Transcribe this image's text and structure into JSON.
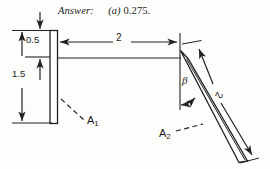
{
  "figure": {
    "answer": {
      "label": "Answer:",
      "part": "(a)",
      "value": "0.275."
    },
    "dimensions": {
      "top_offset": "0.5",
      "lower_height": "1.5",
      "horizontal_span": "2",
      "inclined_length": "2"
    },
    "angle_symbol": "β",
    "plate_labels": {
      "left_plate": "A",
      "left_plate_sub": "1",
      "right_plate": "A",
      "right_plate_sub": "2"
    },
    "colors": {
      "ink": "#1a1a1a",
      "paper": "#fdfdfb",
      "line": "#222222"
    }
  }
}
